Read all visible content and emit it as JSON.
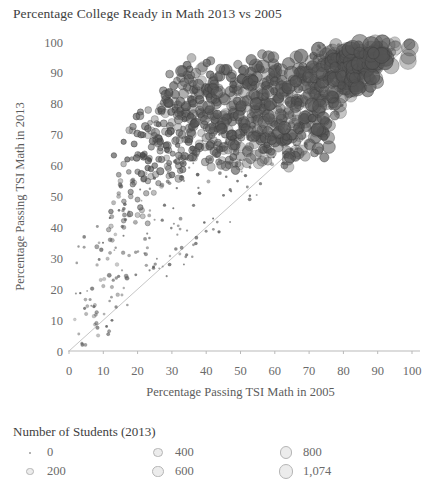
{
  "chart_data": {
    "type": "scatter",
    "title": "Percentage College Ready in Math 2013 vs 2005",
    "xlabel": "Percentage Passing TSI Math in 2005",
    "ylabel": "Percentage Passing TSI Math in 2013",
    "xlim": [
      0,
      100
    ],
    "ylim": [
      0,
      100
    ],
    "xticks": [
      "0",
      "10",
      "20",
      "30",
      "40",
      "50",
      "60",
      "70",
      "80",
      "90",
      "100"
    ],
    "yticks": [
      "0",
      "10",
      "20",
      "30",
      "40",
      "50",
      "60",
      "70",
      "80",
      "90",
      "100"
    ],
    "grid": false,
    "legend_position": "bottom-left",
    "reference_line": {
      "type": "identity",
      "from": [
        0,
        0
      ],
      "to": [
        100,
        100
      ],
      "color": "#c6c6c6"
    },
    "size_encoding": {
      "field": "Number of Students (2013)",
      "title": "Number of Students (2013)",
      "breaks": [
        0,
        200,
        400,
        600,
        800,
        1074
      ],
      "break_labels": [
        "0",
        "200",
        "400",
        "600",
        "800",
        "1,074"
      ],
      "max_value": 1074
    },
    "marker": {
      "shape": "circle",
      "fill": "#555555",
      "stroke": "#3a3a3a",
      "opacity": 0.55
    },
    "series": [
      {
        "name": "Texas high schools",
        "points": [
          [
            5,
            12,
            15
          ],
          [
            8,
            9,
            20
          ],
          [
            10,
            21,
            18
          ],
          [
            12,
            36,
            30
          ],
          [
            13,
            48,
            40
          ],
          [
            14,
            28,
            25
          ],
          [
            15,
            55,
            60
          ],
          [
            16,
            40,
            35
          ],
          [
            17,
            62,
            80
          ],
          [
            18,
            50,
            55
          ],
          [
            19,
            67,
            120
          ],
          [
            20,
            58,
            90
          ],
          [
            20,
            44,
            70
          ],
          [
            21,
            70,
            150
          ],
          [
            22,
            63,
            110
          ],
          [
            23,
            72,
            160
          ],
          [
            23,
            55,
            95
          ],
          [
            24,
            66,
            130
          ],
          [
            25,
            75,
            200
          ],
          [
            25,
            60,
            105
          ],
          [
            26,
            69,
            180
          ],
          [
            27,
            78,
            230
          ],
          [
            27,
            62,
            140
          ],
          [
            28,
            71,
            190
          ],
          [
            29,
            80,
            260
          ],
          [
            29,
            65,
            150
          ],
          [
            30,
            74,
            240
          ],
          [
            30,
            57,
            120
          ],
          [
            31,
            83,
            300
          ],
          [
            31,
            68,
            200
          ],
          [
            32,
            77,
            280
          ],
          [
            32,
            60,
            160
          ],
          [
            33,
            86,
            340
          ],
          [
            33,
            70,
            230
          ],
          [
            34,
            79,
            310
          ],
          [
            34,
            63,
            190
          ],
          [
            35,
            88,
            380
          ],
          [
            35,
            72,
            270
          ],
          [
            36,
            81,
            350
          ],
          [
            36,
            65,
            220
          ],
          [
            37,
            90,
            420
          ],
          [
            37,
            74,
            310
          ],
          [
            38,
            83,
            390
          ],
          [
            38,
            67,
            260
          ],
          [
            39,
            92,
            460
          ],
          [
            39,
            76,
            350
          ],
          [
            40,
            85,
            430
          ],
          [
            40,
            69,
            300
          ],
          [
            41,
            78,
            390
          ],
          [
            41,
            62,
            250
          ],
          [
            42,
            87,
            470
          ],
          [
            42,
            71,
            340
          ],
          [
            43,
            80,
            430
          ],
          [
            43,
            64,
            290
          ],
          [
            44,
            89,
            500
          ],
          [
            44,
            73,
            380
          ],
          [
            45,
            82,
            470
          ],
          [
            45,
            66,
            330
          ],
          [
            46,
            91,
            540
          ],
          [
            46,
            75,
            420
          ],
          [
            47,
            84,
            500
          ],
          [
            47,
            68,
            360
          ],
          [
            48,
            77,
            450
          ],
          [
            48,
            61,
            300
          ],
          [
            49,
            86,
            530
          ],
          [
            49,
            70,
            400
          ],
          [
            50,
            79,
            490
          ],
          [
            50,
            63,
            340
          ],
          [
            51,
            88,
            560
          ],
          [
            51,
            72,
            440
          ],
          [
            52,
            81,
            520
          ],
          [
            52,
            65,
            380
          ],
          [
            53,
            90,
            600
          ],
          [
            53,
            74,
            470
          ],
          [
            54,
            83,
            550
          ],
          [
            54,
            67,
            410
          ],
          [
            55,
            92,
            630
          ],
          [
            55,
            76,
            500
          ],
          [
            56,
            85,
            580
          ],
          [
            56,
            69,
            440
          ],
          [
            57,
            78,
            530
          ],
          [
            57,
            62,
            380
          ],
          [
            58,
            87,
            610
          ],
          [
            58,
            71,
            470
          ],
          [
            59,
            80,
            560
          ],
          [
            59,
            64,
            410
          ],
          [
            60,
            89,
            650
          ],
          [
            60,
            73,
            500
          ],
          [
            61,
            82,
            600
          ],
          [
            61,
            66,
            450
          ],
          [
            62,
            91,
            690
          ],
          [
            62,
            75,
            540
          ],
          [
            63,
            84,
            630
          ],
          [
            63,
            68,
            480
          ],
          [
            64,
            93,
            720
          ],
          [
            64,
            77,
            570
          ],
          [
            65,
            86,
            660
          ],
          [
            65,
            70,
            510
          ],
          [
            66,
            79,
            610
          ],
          [
            66,
            63,
            450
          ],
          [
            67,
            88,
            700
          ],
          [
            67,
            72,
            550
          ],
          [
            68,
            81,
            650
          ],
          [
            68,
            65,
            490
          ],
          [
            69,
            90,
            740
          ],
          [
            69,
            74,
            590
          ],
          [
            70,
            83,
            690
          ],
          [
            70,
            67,
            530
          ],
          [
            71,
            92,
            780
          ],
          [
            71,
            76,
            620
          ],
          [
            72,
            85,
            730
          ],
          [
            72,
            69,
            560
          ],
          [
            73,
            94,
            820
          ],
          [
            73,
            78,
            660
          ],
          [
            74,
            87,
            770
          ],
          [
            74,
            71,
            600
          ],
          [
            75,
            96,
            880
          ],
          [
            75,
            80,
            700
          ],
          [
            76,
            89,
            810
          ],
          [
            76,
            73,
            640
          ],
          [
            77,
            91,
            860
          ],
          [
            77,
            82,
            740
          ],
          [
            78,
            93,
            900
          ],
          [
            78,
            84,
            780
          ],
          [
            79,
            95,
            950
          ],
          [
            79,
            86,
            820
          ],
          [
            80,
            97,
            1000
          ],
          [
            80,
            88,
            860
          ],
          [
            81,
            92,
            910
          ],
          [
            81,
            85,
            800
          ],
          [
            82,
            94,
            960
          ],
          [
            82,
            87,
            840
          ],
          [
            83,
            96,
            1010
          ],
          [
            83,
            89,
            880
          ],
          [
            84,
            93,
            940
          ],
          [
            84,
            86,
            810
          ],
          [
            85,
            97,
            1050
          ],
          [
            85,
            90,
            900
          ],
          [
            86,
            95,
            980
          ],
          [
            86,
            88,
            850
          ],
          [
            87,
            96,
            1020
          ],
          [
            87,
            91,
            920
          ],
          [
            88,
            98,
            1074
          ],
          [
            88,
            93,
            960
          ],
          [
            89,
            97,
            1040
          ],
          [
            90,
            95,
            990
          ],
          [
            91,
            98,
            1060
          ],
          [
            92,
            96,
            1010
          ],
          [
            93,
            99,
            1070
          ],
          [
            95,
            98,
            1050
          ]
        ]
      }
    ]
  }
}
